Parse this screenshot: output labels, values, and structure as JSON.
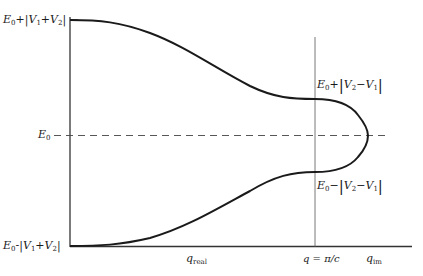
{
  "figure": {
    "type": "band-structure-diagram",
    "y_axis_labels": {
      "top": "E0+|V1+V2|",
      "middle": "E0",
      "bottom": "E0-|V1+V2|"
    },
    "gap_labels": {
      "upper": "E0+|V2-V1|",
      "lower": "E0-|V2-V1|"
    },
    "x_axis_labels": {
      "real": "q_real",
      "boundary": "q = π/c",
      "imag": "q_im"
    },
    "colors": {
      "curve": "#1a1a1a",
      "axes": "#333333",
      "dashed": "#444444",
      "background": "#ffffff"
    },
    "text": {
      "E": "E",
      "sub0": "0",
      "V": "V",
      "sub1": "1",
      "sub2": "2",
      "q": "q",
      "real": "real",
      "im": "im",
      "boundary": "q = π/c"
    }
  }
}
